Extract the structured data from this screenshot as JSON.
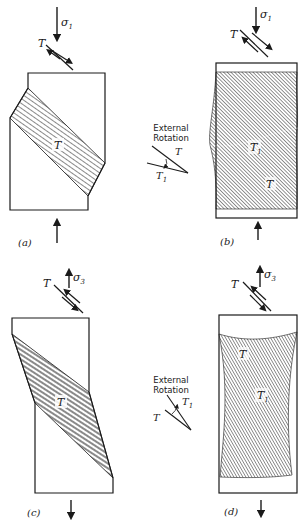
{
  "figure": {
    "panels": [
      {
        "id": "a",
        "caption": "(a)",
        "stress_label": "σ",
        "stress_subscript": "1",
        "stress_direction": "compression",
        "shear_label": "T",
        "band_label": "T"
      },
      {
        "id": "b",
        "caption": "(b)",
        "stress_label": "σ",
        "stress_subscript": "1",
        "stress_direction": "compression",
        "shear_label": "T",
        "band_labels": [
          {
            "text": "T",
            "sub": "1"
          },
          {
            "text": "T",
            "sub": ""
          }
        ]
      },
      {
        "id": "c",
        "caption": "(c)",
        "stress_label": "σ",
        "stress_subscript": "3",
        "stress_direction": "extension",
        "shear_label": "T",
        "band_label": "T"
      },
      {
        "id": "d",
        "caption": "(d)",
        "stress_label": "σ",
        "stress_subscript": "3",
        "stress_direction": "extension",
        "shear_label": "T",
        "band_labels": [
          {
            "text": "T",
            "sub": ""
          },
          {
            "text": "T",
            "sub": "1"
          }
        ]
      }
    ],
    "rotation_insets": [
      {
        "line1": "External",
        "line2": "Rotation",
        "label_a": "T",
        "label_b": "T",
        "label_b_sub": "1"
      },
      {
        "line1": "External",
        "line2": "Rotation",
        "label_a": "T",
        "label_b": "T",
        "label_b_sub": "1"
      }
    ],
    "colors": {
      "ink": "#1a1a1a",
      "background": "#ffffff",
      "hatch": "#2a2a2a"
    }
  }
}
